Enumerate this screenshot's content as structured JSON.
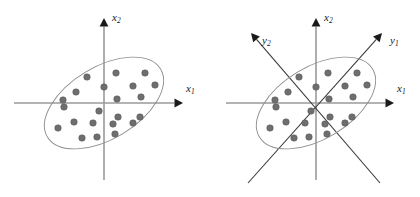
{
  "figure": {
    "title": "",
    "background_color": "#ffffff",
    "width": 420,
    "height": 197
  },
  "style": {
    "dot_color": "#6e6e6e",
    "dot_stroke": "#4f4f4f",
    "ellipse_color": "#8c8c8c",
    "axis_color": "#9a9a9a",
    "diagonal_axis_color": "#3a3a3a",
    "arrow_color": "#1a1a1a",
    "label_color": "#1a1a1a",
    "dot_radius": 3.3
  },
  "chart_data": {
    "type": "scatter",
    "title": "",
    "xlabel": "",
    "ylabel": "",
    "grid": false,
    "legend": "none",
    "panels": [
      {
        "id": "left",
        "name": "original-coordinate-system",
        "origin": [
          104,
          103
        ],
        "axes": [
          {
            "name": "x1",
            "label": "x",
            "subscript": "1",
            "label_x": 186,
            "label_y": 88,
            "from": [
              14,
              103
            ],
            "to": [
              183,
              103
            ],
            "arrow_angle_deg": 0,
            "style": "horizontal"
          },
          {
            "name": "x2",
            "label": "x",
            "subscript": "2",
            "label_x": 112,
            "label_y": 17,
            "from": [
              104,
              180
            ],
            "to": [
              104,
              18
            ],
            "arrow_angle_deg": 270,
            "style": "vertical"
          }
        ],
        "ellipse": {
          "cx": 104,
          "cy": 103,
          "rx": 66,
          "ry": 36,
          "rotation_deg": -31
        },
        "points": [
          [
            87,
            77
          ],
          [
            116,
            73
          ],
          [
            145,
            73
          ],
          [
            76,
            92
          ],
          [
            104,
            87
          ],
          [
            133,
            86
          ],
          [
            155,
            85
          ],
          [
            63,
            100
          ],
          [
            117,
            99
          ],
          [
            141,
            97
          ],
          [
            99,
            111
          ],
          [
            118,
            117
          ],
          [
            140,
            117
          ],
          [
            93,
            123
          ],
          [
            113,
            124
          ],
          [
            133,
            123
          ],
          [
            58,
            128
          ],
          [
            74,
            122
          ],
          [
            115,
            134
          ],
          [
            82,
            138
          ],
          [
            97,
            137
          ],
          [
            64,
            107
          ]
        ]
      },
      {
        "id": "right",
        "name": "rotated-principal-axis-system",
        "origin": [
          316,
          103
        ],
        "axes": [
          {
            "name": "x1",
            "label": "x",
            "subscript": "1",
            "label_x": 397,
            "label_y": 88,
            "from": [
              226,
              103
            ],
            "to": [
              394,
              103
            ],
            "arrow_angle_deg": 0,
            "style": "horizontal"
          },
          {
            "name": "x2",
            "label": "x",
            "subscript": "2",
            "label_x": 324,
            "label_y": 17,
            "from": [
              316,
              180
            ],
            "to": [
              316,
              18
            ],
            "arrow_angle_deg": 270,
            "style": "vertical"
          },
          {
            "name": "y1",
            "label": "y",
            "subscript": "1",
            "label_x": 390,
            "label_y": 40,
            "from": [
              248,
              183
            ],
            "to": [
              382,
              33
            ],
            "arrow_angle_deg": 311,
            "style": "diagonal"
          },
          {
            "name": "y2",
            "label": "y",
            "subscript": "2",
            "label_x": 262,
            "label_y": 40,
            "from": [
              380,
              183
            ],
            "to": [
              251,
              33
            ],
            "arrow_angle_deg": 229,
            "style": "diagonal"
          }
        ],
        "ellipse": {
          "cx": 316,
          "cy": 103,
          "rx": 66,
          "ry": 36,
          "rotation_deg": -31
        },
        "points": [
          [
            299,
            77
          ],
          [
            328,
            73
          ],
          [
            357,
            73
          ],
          [
            288,
            92
          ],
          [
            316,
            87
          ],
          [
            345,
            86
          ],
          [
            367,
            85
          ],
          [
            275,
            100
          ],
          [
            329,
            99
          ],
          [
            353,
            97
          ],
          [
            311,
            111
          ],
          [
            330,
            117
          ],
          [
            352,
            117
          ],
          [
            305,
            123
          ],
          [
            325,
            124
          ],
          [
            345,
            123
          ],
          [
            270,
            128
          ],
          [
            286,
            122
          ],
          [
            327,
            134
          ],
          [
            294,
            138
          ],
          [
            309,
            137
          ],
          [
            276,
            107
          ]
        ]
      }
    ]
  }
}
